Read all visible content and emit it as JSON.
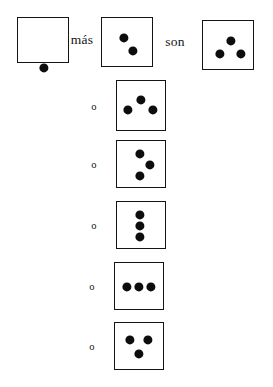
{
  "worksheet": {
    "language": "es",
    "equation_text": "1 más 2 son 3",
    "operator_label": "más",
    "result_label": "son",
    "alternative_label": "o",
    "dot_color": "#0d0d0d",
    "box_border_color": "#141414",
    "background_color": "#ffffff"
  },
  "equation": {
    "addend_one": {
      "name": "box-one-dot",
      "count": "1",
      "box": {
        "x": 17,
        "y": 17,
        "w": 52,
        "h": 46
      },
      "dots": [
        {
          "cx": 26,
          "cy": 50
        }
      ]
    },
    "operator": {
      "label": "más",
      "x": 82,
      "y": 40
    },
    "addend_two": {
      "name": "box-two-dots",
      "count": "2",
      "box": {
        "x": 101,
        "y": 17,
        "w": 52,
        "h": 50
      },
      "dots": [
        {
          "cx": 22,
          "cy": 20
        },
        {
          "cx": 31,
          "cy": 33
        }
      ]
    },
    "result_word": {
      "label": "son",
      "x": 175,
      "y": 42
    },
    "sum": {
      "name": "box-three-dots-sum",
      "count": "3",
      "box": {
        "x": 202,
        "y": 20,
        "w": 52,
        "h": 50
      },
      "dots": [
        {
          "cx": 28,
          "cy": 20
        },
        {
          "cx": 17,
          "cy": 33
        },
        {
          "cx": 38,
          "cy": 33
        }
      ]
    }
  },
  "alternatives": [
    {
      "name": "alt-arrangement-1",
      "label": "o",
      "count": "3",
      "pattern": "one-top-two-bottom",
      "box": {
        "x": 116,
        "y": 80,
        "w": 50,
        "h": 51
      },
      "dots": [
        {
          "cx": 24,
          "cy": 19
        },
        {
          "cx": 11,
          "cy": 29
        },
        {
          "cx": 36,
          "cy": 29
        }
      ]
    },
    {
      "name": "alt-arrangement-2",
      "label": "o",
      "count": "3",
      "pattern": "zigzag-left-right-left",
      "box": {
        "x": 116,
        "y": 140,
        "w": 50,
        "h": 48
      },
      "dots": [
        {
          "cx": 23,
          "cy": 13
        },
        {
          "cx": 33,
          "cy": 24
        },
        {
          "cx": 23,
          "cy": 35
        }
      ]
    },
    {
      "name": "alt-arrangement-3",
      "label": "o",
      "count": "3",
      "pattern": "vertical-line",
      "box": {
        "x": 116,
        "y": 201,
        "w": 50,
        "h": 48
      },
      "dots": [
        {
          "cx": 23,
          "cy": 13
        },
        {
          "cx": 23,
          "cy": 24
        },
        {
          "cx": 23,
          "cy": 35
        }
      ]
    },
    {
      "name": "alt-arrangement-4",
      "label": "o",
      "count": "3",
      "pattern": "horizontal-line",
      "box": {
        "x": 114,
        "y": 262,
        "w": 50,
        "h": 48
      },
      "dots": [
        {
          "cx": 12,
          "cy": 24
        },
        {
          "cx": 24,
          "cy": 24
        },
        {
          "cx": 36,
          "cy": 24
        }
      ]
    },
    {
      "name": "alt-arrangement-5",
      "label": "o",
      "count": "3",
      "pattern": "two-top-one-bottom",
      "box": {
        "x": 114,
        "y": 322,
        "w": 50,
        "h": 48
      },
      "dots": [
        {
          "cx": 15,
          "cy": 17
        },
        {
          "cx": 33,
          "cy": 17
        },
        {
          "cx": 24,
          "cy": 31
        }
      ]
    }
  ],
  "dot_radius": 4.6,
  "alt_label_offset_x": 22
}
